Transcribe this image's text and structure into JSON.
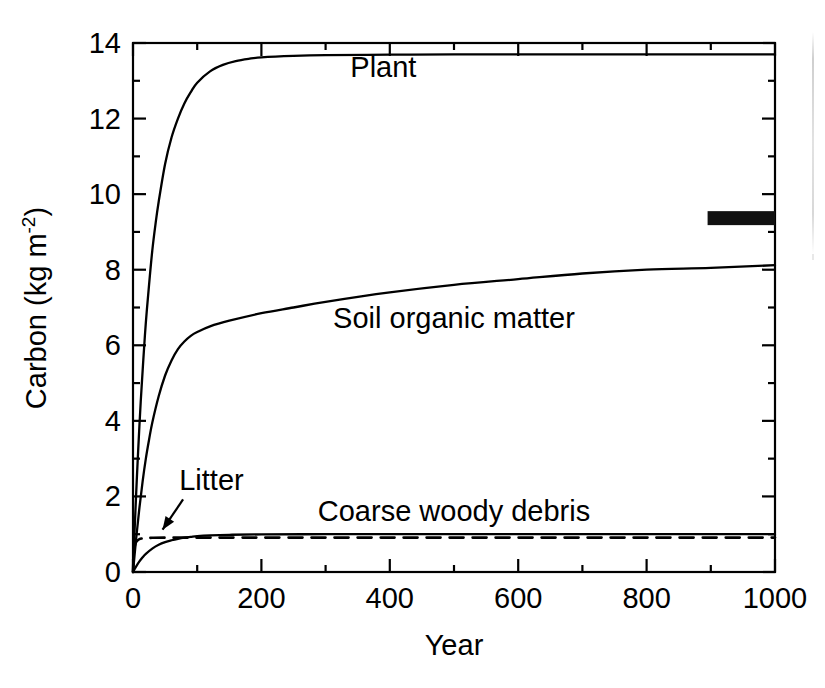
{
  "chart_data": {
    "type": "line",
    "title": "",
    "subtitle": "",
    "xlabel": "Year",
    "ylabel": "Carbon (kg m",
    "ylabel_sup": "-2",
    "ylabel_tail": ")",
    "ylabel_unit_lead": " (kg m",
    "xlim": [
      0,
      1000
    ],
    "ylim": [
      0,
      14
    ],
    "xticks": [
      0,
      200,
      400,
      600,
      800,
      1000
    ],
    "xtick_labels": [
      "0",
      "200",
      "400",
      "600",
      "800",
      "1000"
    ],
    "yticks": [
      0,
      2,
      4,
      6,
      8,
      10,
      12,
      14
    ],
    "ytick_labels": [
      "0",
      "2",
      "4",
      "6",
      "8",
      "10",
      "12",
      "14"
    ],
    "x_minor_ticks": [
      100,
      300,
      500,
      700,
      900
    ],
    "y_minor_ticks": [
      1,
      3,
      5,
      7,
      9,
      11,
      13
    ],
    "grid": false,
    "legend_position": "inline-annotations",
    "series": [
      {
        "name": "Plant",
        "style": "solid",
        "label": "Plant",
        "label_x": 390,
        "label_y": 13.1,
        "points": [
          [
            0,
            0.0
          ],
          [
            2,
            0.9
          ],
          [
            5,
            2.1
          ],
          [
            8,
            3.2
          ],
          [
            12,
            4.5
          ],
          [
            16,
            5.6
          ],
          [
            20,
            6.6
          ],
          [
            25,
            7.6
          ],
          [
            30,
            8.5
          ],
          [
            35,
            9.2
          ],
          [
            40,
            9.8
          ],
          [
            50,
            10.8
          ],
          [
            60,
            11.5
          ],
          [
            70,
            12.0
          ],
          [
            80,
            12.4
          ],
          [
            90,
            12.7
          ],
          [
            100,
            12.95
          ],
          [
            120,
            13.25
          ],
          [
            140,
            13.42
          ],
          [
            160,
            13.52
          ],
          [
            180,
            13.58
          ],
          [
            200,
            13.62
          ],
          [
            250,
            13.66
          ],
          [
            300,
            13.68
          ],
          [
            400,
            13.69
          ],
          [
            500,
            13.7
          ],
          [
            600,
            13.7
          ],
          [
            700,
            13.7
          ],
          [
            800,
            13.7
          ],
          [
            900,
            13.7
          ],
          [
            1000,
            13.7
          ]
        ]
      },
      {
        "name": "Soil organic matter",
        "style": "solid",
        "label": "Soil organic matter",
        "label_x": 500,
        "label_y": 6.45,
        "points": [
          [
            0,
            0.0
          ],
          [
            5,
            0.9
          ],
          [
            10,
            1.7
          ],
          [
            15,
            2.4
          ],
          [
            20,
            3.0
          ],
          [
            25,
            3.5
          ],
          [
            30,
            3.95
          ],
          [
            40,
            4.65
          ],
          [
            50,
            5.2
          ],
          [
            60,
            5.6
          ],
          [
            70,
            5.9
          ],
          [
            80,
            6.1
          ],
          [
            90,
            6.25
          ],
          [
            100,
            6.35
          ],
          [
            120,
            6.5
          ],
          [
            150,
            6.65
          ],
          [
            200,
            6.85
          ],
          [
            250,
            7.0
          ],
          [
            300,
            7.15
          ],
          [
            400,
            7.4
          ],
          [
            500,
            7.6
          ],
          [
            600,
            7.75
          ],
          [
            700,
            7.9
          ],
          [
            800,
            8.0
          ],
          [
            900,
            8.05
          ],
          [
            1000,
            8.12
          ]
        ]
      },
      {
        "name": "Coarse woody debris",
        "style": "solid",
        "label": "Coarse woody debris",
        "label_x": 500,
        "label_y": 1.35,
        "points": [
          [
            0,
            0.0
          ],
          [
            5,
            0.15
          ],
          [
            10,
            0.28
          ],
          [
            15,
            0.39
          ],
          [
            20,
            0.48
          ],
          [
            30,
            0.62
          ],
          [
            40,
            0.72
          ],
          [
            50,
            0.79
          ],
          [
            60,
            0.84
          ],
          [
            70,
            0.88
          ],
          [
            80,
            0.91
          ],
          [
            90,
            0.93
          ],
          [
            100,
            0.95
          ],
          [
            120,
            0.97
          ],
          [
            150,
            0.985
          ],
          [
            200,
            0.995
          ],
          [
            300,
            1.0
          ],
          [
            400,
            1.0
          ],
          [
            600,
            1.0
          ],
          [
            800,
            1.0
          ],
          [
            1000,
            1.0
          ]
        ]
      },
      {
        "name": "Litter",
        "style": "dashed",
        "label": "Litter",
        "label_x": 72,
        "label_y": 2.18,
        "points": [
          [
            0,
            0.0
          ],
          [
            1,
            0.45
          ],
          [
            2,
            0.62
          ],
          [
            4,
            0.76
          ],
          [
            6,
            0.82
          ],
          [
            10,
            0.87
          ],
          [
            15,
            0.89
          ],
          [
            20,
            0.9
          ],
          [
            30,
            0.905
          ],
          [
            50,
            0.91
          ],
          [
            80,
            0.91
          ],
          [
            120,
            0.91
          ],
          [
            200,
            0.91
          ],
          [
            400,
            0.91
          ],
          [
            600,
            0.91
          ],
          [
            800,
            0.91
          ],
          [
            1000,
            0.91
          ]
        ]
      }
    ],
    "annotations": [
      {
        "name": "litter-arrow",
        "type": "arrow",
        "from_x": 78,
        "from_y": 1.92,
        "to_x": 46,
        "to_y": 1.12
      },
      {
        "name": "observed-carbon-marker",
        "type": "filled-rect",
        "x0": 895,
        "x1": 1000,
        "y0": 9.18,
        "y1": 9.55,
        "color": "#111111"
      }
    ],
    "colors": {
      "axis": "#000000",
      "curve": "#000000",
      "background": "#ffffff",
      "marker": "#111111"
    }
  },
  "figure": {
    "axis_label_x": "Year",
    "axis_label_y_main": "Carbon (kg m",
    "axis_label_y_sup": "-2",
    "axis_label_y_end": ")"
  }
}
